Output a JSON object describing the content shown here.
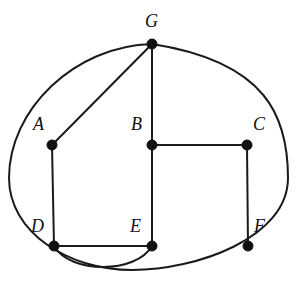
{
  "figure": {
    "width": 305,
    "height": 284,
    "background_color": "#ffffff",
    "stroke_color": "#1a1a1a",
    "vertex_color": "#111111"
  },
  "vertices": [
    {
      "id": "G",
      "label": "G",
      "x": 152,
      "y": 44,
      "label_x": 145,
      "label_y": 12,
      "radius": 5
    },
    {
      "id": "A",
      "label": "A",
      "x": 52,
      "y": 145,
      "label_x": 33,
      "label_y": 115,
      "radius": 5
    },
    {
      "id": "B",
      "label": "B",
      "x": 152,
      "y": 145,
      "label_x": 131,
      "label_y": 115,
      "radius": 5
    },
    {
      "id": "C",
      "label": "C",
      "x": 247,
      "y": 145,
      "label_x": 253,
      "label_y": 115,
      "radius": 5
    },
    {
      "id": "D",
      "label": "D",
      "x": 54,
      "y": 246,
      "label_x": 31,
      "label_y": 217,
      "radius": 5
    },
    {
      "id": "E",
      "label": "E",
      "x": 152,
      "y": 246,
      "label_x": 130,
      "label_y": 217,
      "radius": 5
    },
    {
      "id": "F",
      "label": "F",
      "x": 248,
      "y": 246,
      "label_x": 254,
      "label_y": 217,
      "radius": 5
    }
  ],
  "edges": [
    {
      "id": "edge-G-A",
      "from": "G",
      "to": "A",
      "kind": "line",
      "path": "M 152 44 L 52 145"
    },
    {
      "id": "edge-G-B",
      "from": "G",
      "to": "B",
      "kind": "line",
      "path": "M 152 44 L 152 145"
    },
    {
      "id": "edge-B-C",
      "from": "B",
      "to": "C",
      "kind": "line",
      "path": "M 152 145 L 247 145"
    },
    {
      "id": "edge-B-E",
      "from": "B",
      "to": "E",
      "kind": "line",
      "path": "M 152 145 L 152 246"
    },
    {
      "id": "edge-A-D",
      "from": "A",
      "to": "D",
      "kind": "line",
      "path": "M 52 145 L 54 246"
    },
    {
      "id": "edge-C-F",
      "from": "C",
      "to": "F",
      "kind": "line",
      "path": "M 247 145 L 248 246"
    },
    {
      "id": "edge-D-E",
      "from": "D",
      "to": "E",
      "kind": "line",
      "path": "M 54 246 L 152 246"
    },
    {
      "id": "edge-D-E-arc",
      "from": "D",
      "to": "E",
      "kind": "curve",
      "path": "M 54 246 C 70 274, 136 274, 152 246"
    },
    {
      "id": "edge-G-F-outer",
      "from": "G",
      "to": "F",
      "kind": "curve",
      "path": "M 152 44 C 74 46, 9 110, 9 178 C 9 232, 68 270, 132 270 C 196 270, 288 238, 288 178 C 288 118, 268 62, 152 44"
    }
  ],
  "legend": {
    "vertex_count": 7,
    "edge_count": 9
  }
}
